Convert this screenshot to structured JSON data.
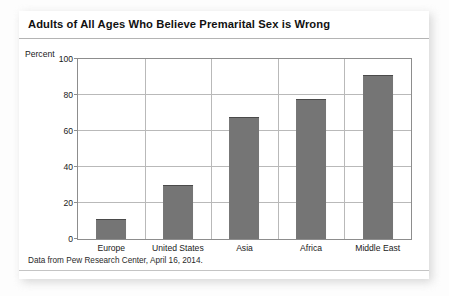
{
  "chart_data": {
    "type": "bar",
    "title": "Adults of All Ages Who Believe Premarital Sex is Wrong",
    "categories": [
      "Europe",
      "United States",
      "Asia",
      "Africa",
      "Middle East"
    ],
    "values": [
      11,
      30,
      68,
      78,
      91
    ],
    "xlabel": "",
    "ylabel": "Percent",
    "ylim": [
      0,
      100
    ],
    "yticks": [
      0,
      20,
      40,
      60,
      80,
      100
    ],
    "ytick_labels": [
      "0",
      "20",
      "40",
      "60",
      "80",
      "100"
    ],
    "grid": true,
    "legend": false,
    "bar_color": "#757575",
    "bar_edge_color": "#4a4a4a",
    "gridline_color": "#b9b9b9",
    "axis_color": "#8d8d8d",
    "source_note": "Data from Pew Research Center, April 16, 2014."
  },
  "card": {
    "background": "#ffffff"
  }
}
